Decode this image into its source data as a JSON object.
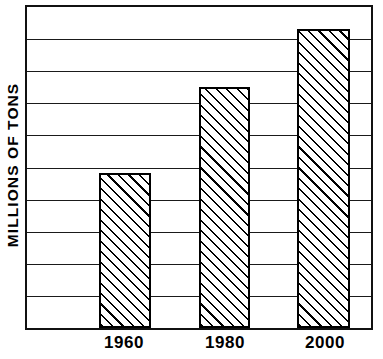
{
  "chart_data": {
    "type": "bar",
    "title": "",
    "xlabel": "",
    "ylabel": "MILLIONS OF TONS",
    "categories": [
      "1960",
      "1980",
      "2000"
    ],
    "values": [
      4.83,
      7.5,
      9.3
    ],
    "ylim": [
      0,
      10
    ],
    "y_tick_labels": [],
    "gridlines": {
      "visible": true,
      "count": 9,
      "orientation": "horizontal",
      "positions": [
        1,
        2,
        3,
        4,
        5,
        6,
        7,
        8,
        9
      ]
    },
    "legend": {
      "visible": false,
      "position": "none"
    },
    "style": {
      "bar_fill": "diagonal-hatch",
      "bar_hatch_direction": "positive-slope-45deg",
      "bar_outline_color": "#000000",
      "frame_color": "#111111",
      "background": "#ffffff"
    },
    "annotations": []
  },
  "axis": {
    "y_title": "MILLIONS OF TONS"
  },
  "bars": [
    {
      "label": "1960",
      "value": 4.83,
      "center_frac": 0.2845,
      "width_frac": 0.1523
    },
    {
      "label": "1980",
      "value": 7.5,
      "center_frac": 0.5747,
      "width_frac": 0.1495
    },
    {
      "label": "2000",
      "value": 9.3,
      "center_frac": 0.8621,
      "width_frac": 0.1523
    }
  ]
}
